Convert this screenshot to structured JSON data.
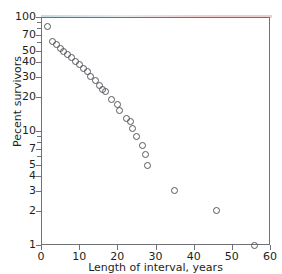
{
  "chart_data": {
    "type": "scatter",
    "title": "",
    "xlabel": "Length of interval, years",
    "ylabel": "Pecent survivors",
    "xlim": [
      0,
      60
    ],
    "ylim": [
      1,
      100
    ],
    "yscale": "log",
    "xscale": "linear",
    "grid": false,
    "legend": null,
    "xticks": [
      0,
      10,
      20,
      30,
      40,
      50,
      60
    ],
    "xtick_labels": [
      "0",
      "10",
      "20",
      "30",
      "40",
      "50",
      "60"
    ],
    "yticks": [
      1,
      2,
      3,
      4,
      5,
      7,
      10,
      20,
      30,
      40,
      50,
      70,
      100
    ],
    "ytick_labels": [
      "1",
      "2",
      "3",
      "4",
      "5",
      "7",
      "10",
      "20",
      "30",
      "40",
      "50",
      "70",
      "100"
    ],
    "marker": "open-circle",
    "marker_color": "#55585c",
    "points": [
      {
        "x": 1.8,
        "y": 82
      },
      {
        "x": 3.0,
        "y": 61
      },
      {
        "x": 4.0,
        "y": 57
      },
      {
        "x": 5.0,
        "y": 53
      },
      {
        "x": 6.0,
        "y": 50
      },
      {
        "x": 7.0,
        "y": 47
      },
      {
        "x": 8.0,
        "y": 44
      },
      {
        "x": 9.0,
        "y": 41
      },
      {
        "x": 10.2,
        "y": 38
      },
      {
        "x": 11.2,
        "y": 35
      },
      {
        "x": 12.2,
        "y": 33
      },
      {
        "x": 13.0,
        "y": 30
      },
      {
        "x": 14.2,
        "y": 28
      },
      {
        "x": 15.2,
        "y": 25
      },
      {
        "x": 16.2,
        "y": 23
      },
      {
        "x": 17.0,
        "y": 22
      },
      {
        "x": 18.5,
        "y": 19
      },
      {
        "x": 20.0,
        "y": 17
      },
      {
        "x": 20.5,
        "y": 15
      },
      {
        "x": 22.5,
        "y": 13
      },
      {
        "x": 23.5,
        "y": 12
      },
      {
        "x": 24.0,
        "y": 10.5
      },
      {
        "x": 25.0,
        "y": 9
      },
      {
        "x": 26.5,
        "y": 7.5
      },
      {
        "x": 27.5,
        "y": 6.2
      },
      {
        "x": 28.0,
        "y": 5.0
      },
      {
        "x": 35.0,
        "y": 3.0
      },
      {
        "x": 46.0,
        "y": 2.0
      },
      {
        "x": 56.0,
        "y": 1.0
      }
    ]
  },
  "accessibility": {
    "figure_name": "percent-survivors-vs-interval-length-semilog-scatter"
  }
}
